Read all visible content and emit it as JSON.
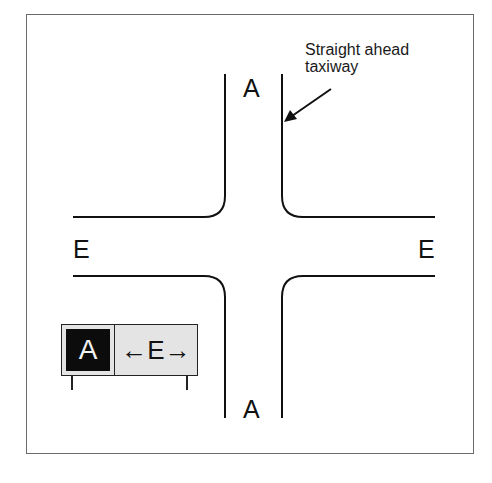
{
  "diagram": {
    "callout": {
      "line1": "Straight ahead",
      "line2": "taxiway"
    },
    "labels": {
      "top": "A",
      "bottom": "A",
      "left": "E",
      "right": "E"
    },
    "sign": {
      "location_label": "A",
      "direction_label": "←E→",
      "location_colors": {
        "background": "#0c0c0c",
        "text": "#f2f2f2"
      },
      "direction_colors": {
        "background": "#e4e4e4",
        "text": "#111111"
      }
    }
  }
}
